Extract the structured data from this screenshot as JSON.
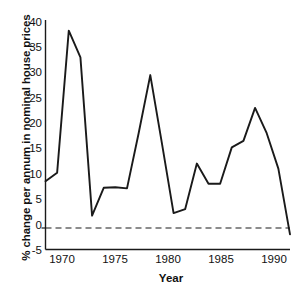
{
  "chart_data": {
    "type": "line",
    "title": "",
    "xlabel": "Year",
    "ylabel": "% change per annum in nominal house prices",
    "xlim": [
      1969,
      1990
    ],
    "ylim": [
      -5,
      40
    ],
    "grid": false,
    "legend": null,
    "zero_reference_line": {
      "value": 0,
      "style": "dashed"
    },
    "xticks": [
      1970,
      1975,
      1980,
      1985,
      1990
    ],
    "xtick_labels": [
      "1970",
      "1975",
      "1980",
      "1985",
      "1990"
    ],
    "yticks": [
      -5,
      0,
      5,
      10,
      15,
      20,
      25,
      30,
      35,
      40
    ],
    "ytick_labels": [
      "-5",
      "0",
      "5",
      "10",
      "15",
      "20",
      "25",
      "30",
      "35",
      "40"
    ],
    "series": [
      {
        "name": "% change per annum in nominal house prices",
        "color": "#1a1a1a",
        "x": [
          1969,
          1970,
          1971,
          1972,
          1973,
          1974,
          1975,
          1976,
          1977,
          1978,
          1979,
          1980,
          1981,
          1982,
          1983,
          1984,
          1985,
          1986,
          1987,
          1988,
          1989,
          1990
        ],
        "values": [
          8.5,
          10.2,
          38.3,
          33.0,
          1.7,
          7.2,
          7.3,
          7.1,
          18.0,
          29.5,
          16.0,
          2.2,
          3.0,
          12.0,
          8.0,
          8.0,
          15.2,
          16.5,
          23.0,
          18.0,
          11.0,
          -2.0
        ]
      }
    ]
  }
}
